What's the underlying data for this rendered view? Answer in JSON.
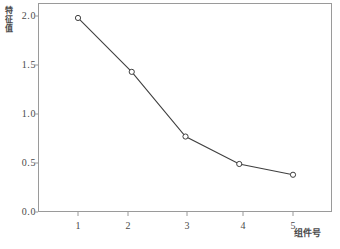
{
  "chart_data": {
    "type": "line",
    "title": "",
    "subtitle": "",
    "xlabel": "组件号",
    "ylabel": "特征值",
    "x": [
      1,
      2,
      3,
      4,
      5
    ],
    "values": [
      1.98,
      1.43,
      0.77,
      0.49,
      0.38
    ],
    "series": [
      {
        "name": "特征值",
        "values": [
          1.98,
          1.43,
          0.77,
          0.49,
          0.38
        ]
      }
    ],
    "xticks": [
      "1",
      "2",
      "3",
      "4",
      "5"
    ],
    "yticks": [
      "0.0",
      "0.5",
      "1.0",
      "1.5",
      "2.0"
    ],
    "xlim": [
      0.3,
      5.7
    ],
    "ylim": [
      0.0,
      2.13
    ],
    "grid": false,
    "legend": false,
    "legend_position": "none",
    "marker": "open-circle",
    "line_color": "#3f3f3f",
    "marker_color": "#3f3f3f",
    "frame_color": "#9a9a9a",
    "background_color": "#ffffff",
    "annotations": []
  },
  "axes": {
    "y_label_text": "特征值",
    "x_label_text": "组件号",
    "y_tick_labels": [
      "2.0",
      "1.5",
      "1.0",
      "0.5",
      "0.0"
    ],
    "x_tick_labels": [
      "1",
      "2",
      "3",
      "4",
      "5"
    ]
  }
}
